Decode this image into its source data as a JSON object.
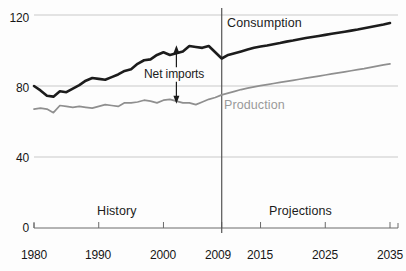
{
  "chart_data": {
    "type": "line",
    "title": "",
    "xlabel": "",
    "ylabel": "",
    "xlim": [
      1980,
      2035
    ],
    "ylim": [
      0,
      125
    ],
    "grid": true,
    "gridlines_y": [
      0,
      40,
      80,
      120
    ],
    "yticks": [
      "0",
      "40",
      "80",
      "120"
    ],
    "ytick_values": [
      0,
      40,
      80,
      120
    ],
    "xticks": [
      "1980",
      "1990",
      "2000",
      "2009",
      "2015",
      "2025",
      "2035"
    ],
    "xtick_values": [
      1980,
      1990,
      2000,
      2009,
      2015,
      2025,
      2035
    ],
    "legend_position": "inline-annotations",
    "annotations": [
      {
        "name": "net-imports",
        "text": "Net imports",
        "x": 2001,
        "y": 88
      },
      {
        "name": "history",
        "text": "History",
        "x": 1994,
        "y": 14
      },
      {
        "name": "projections",
        "text": "Projections",
        "x": 2021,
        "y": 14
      },
      {
        "name": "divider",
        "text": "",
        "x": 2009
      }
    ],
    "series": [
      {
        "name": "Consumption",
        "color": "#1c1c1c",
        "label_x": 2012,
        "label_y": 119,
        "x": [
          1980,
          1981,
          1982,
          1983,
          1984,
          1985,
          1986,
          1987,
          1988,
          1989,
          1990,
          1991,
          1992,
          1993,
          1994,
          1995,
          1996,
          1997,
          1998,
          1999,
          2000,
          2001,
          2002,
          2003,
          2004,
          2005,
          2006,
          2007,
          2008,
          2009,
          2010,
          2011,
          2012,
          2013,
          2014,
          2015,
          2016,
          2017,
          2018,
          2019,
          2020,
          2021,
          2022,
          2023,
          2024,
          2025,
          2026,
          2027,
          2028,
          2029,
          2030,
          2031,
          2032,
          2033,
          2034,
          2035
        ],
        "values": [
          80.0,
          77.5,
          74.5,
          74.0,
          77.0,
          76.5,
          78.5,
          80.5,
          83.0,
          84.5,
          84.0,
          83.5,
          85.0,
          86.5,
          88.5,
          89.5,
          92.5,
          94.5,
          95.0,
          97.5,
          99.0,
          97.5,
          98.5,
          99.5,
          102.5,
          102.0,
          101.5,
          102.5,
          99.0,
          95.5,
          97.5,
          98.5,
          99.5,
          100.5,
          101.5,
          102.2,
          102.8,
          103.5,
          104.2,
          105.0,
          105.6,
          106.3,
          107.0,
          107.6,
          108.2,
          108.8,
          109.4,
          110.0,
          110.6,
          111.2,
          111.8,
          112.5,
          113.2,
          113.9,
          114.6,
          115.5
        ]
      },
      {
        "name": "Production",
        "color": "#8f8f8f",
        "label_x": 2011,
        "label_y": 76,
        "x": [
          1980,
          1981,
          1982,
          1983,
          1984,
          1985,
          1986,
          1987,
          1988,
          1989,
          1990,
          1991,
          1992,
          1993,
          1994,
          1995,
          1996,
          1997,
          1998,
          1999,
          2000,
          2001,
          2002,
          2003,
          2004,
          2005,
          2006,
          2007,
          2008,
          2009,
          2010,
          2011,
          2012,
          2013,
          2014,
          2015,
          2016,
          2017,
          2018,
          2019,
          2020,
          2021,
          2022,
          2023,
          2024,
          2025,
          2026,
          2027,
          2028,
          2029,
          2030,
          2031,
          2032,
          2033,
          2034,
          2035
        ],
        "values": [
          67.0,
          67.5,
          67.0,
          65.0,
          69.0,
          68.5,
          68.0,
          68.5,
          68.0,
          67.5,
          68.5,
          69.5,
          69.0,
          68.5,
          70.5,
          70.5,
          71.0,
          72.0,
          71.5,
          70.5,
          72.0,
          72.5,
          71.5,
          70.5,
          70.5,
          69.5,
          71.0,
          72.5,
          73.5,
          75.0,
          76.0,
          77.0,
          78.0,
          78.8,
          79.5,
          80.2,
          80.8,
          81.4,
          82.0,
          82.6,
          83.2,
          83.8,
          84.4,
          85.0,
          85.6,
          86.2,
          86.8,
          87.4,
          88.0,
          88.6,
          89.2,
          89.8,
          90.5,
          91.2,
          91.9,
          92.5
        ]
      }
    ],
    "net_imports_arrow": {
      "x": 2002,
      "top": 103,
      "bottom": 70
    }
  },
  "yaxis": {
    "ticks": [
      {
        "label": "120"
      },
      {
        "label": "80"
      },
      {
        "label": "40"
      },
      {
        "label": "0"
      }
    ]
  },
  "xaxis": {
    "ticks": [
      {
        "label": "1980"
      },
      {
        "label": "1990"
      },
      {
        "label": "2000"
      },
      {
        "label": "2009"
      },
      {
        "label": "2015"
      },
      {
        "label": "2025"
      },
      {
        "label": "2035"
      }
    ]
  },
  "labels": {
    "consumption": "Consumption",
    "production": "Production",
    "net_imports": "Net imports",
    "history": "History",
    "projections": "Projections"
  },
  "colors": {
    "consumption": "#1c1c1c",
    "production": "#8f8f8f",
    "grid": "#c8c8c8",
    "axis": "#555555",
    "text": "#161616"
  }
}
